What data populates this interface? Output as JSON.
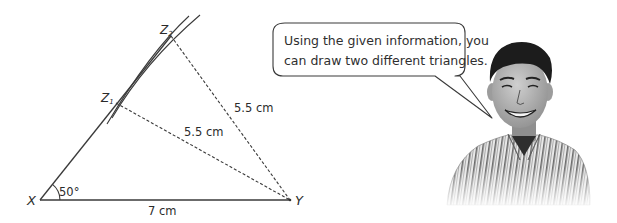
{
  "diagram": {
    "type": "ambiguous-case-triangle-construction",
    "points": {
      "X": {
        "label": "X",
        "x": 40,
        "y": 200
      },
      "Y": {
        "label": "Y",
        "x": 290,
        "y": 200
      },
      "Z1": {
        "label": "Z",
        "subscript": "1",
        "x": 116,
        "y": 103
      },
      "Z2": {
        "label": "Z",
        "subscript": "2",
        "x": 171,
        "y": 36
      }
    },
    "segments": [
      {
        "from": "X",
        "to": "Y",
        "style": "solid",
        "label": "7 cm"
      },
      {
        "from": "X",
        "to": "Z2",
        "style": "solid",
        "label": ""
      },
      {
        "from": "Z1",
        "to": "Y",
        "style": "dashed",
        "label": "5.5 cm"
      },
      {
        "from": "Z2",
        "to": "Y",
        "style": "dashed",
        "label": "5.5 cm"
      }
    ],
    "angle": {
      "vertex": "X",
      "label": "50°"
    },
    "labels": {
      "X": "X",
      "Y": "Y",
      "Z1_main": "Z",
      "Z1_sub": "1",
      "Z2_main": "Z",
      "Z2_sub": "2",
      "base": "7 cm",
      "z1y": "5.5 cm",
      "z2y": "5.5 cm",
      "angle": "50°"
    }
  },
  "speech_bubble": {
    "line1": "Using the given information, you",
    "line2": "can draw two different triangles."
  },
  "character": {
    "description": "smiling boy in striped collared shirt",
    "icon": "student-illustration"
  },
  "colors": {
    "line": "#333333",
    "text": "#2b2b2b",
    "background": "#ffffff"
  }
}
